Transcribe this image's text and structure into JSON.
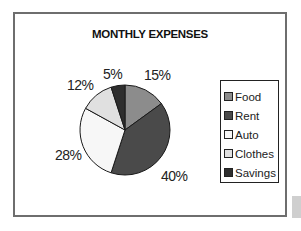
{
  "chart_data": {
    "type": "pie",
    "title": "MONTHLY EXPENSES",
    "categories": [
      "Food",
      "Rent",
      "Auto",
      "Clothes",
      "Savings"
    ],
    "values": [
      15,
      40,
      28,
      12,
      5
    ],
    "labels": [
      "15%",
      "40%",
      "28%",
      "12%",
      "5%"
    ],
    "colors": [
      "#8c8c8c",
      "#4a4a4a",
      "#f7f7f7",
      "#e0e0e0",
      "#2e2e2e"
    ],
    "legend_position": "right",
    "unit": "%"
  },
  "legend": {
    "items": [
      {
        "label": "Food",
        "color": "#8c8c8c"
      },
      {
        "label": "Rent",
        "color": "#4a4a4a"
      },
      {
        "label": "Auto",
        "color": "#f7f7f7"
      },
      {
        "label": "Clothes",
        "color": "#e0e0e0"
      },
      {
        "label": "Savings",
        "color": "#2e2e2e"
      }
    ]
  },
  "pie_labels": {
    "food": "15%",
    "rent": "40%",
    "auto": "28%",
    "clothes": "12%",
    "savings": "5%"
  }
}
